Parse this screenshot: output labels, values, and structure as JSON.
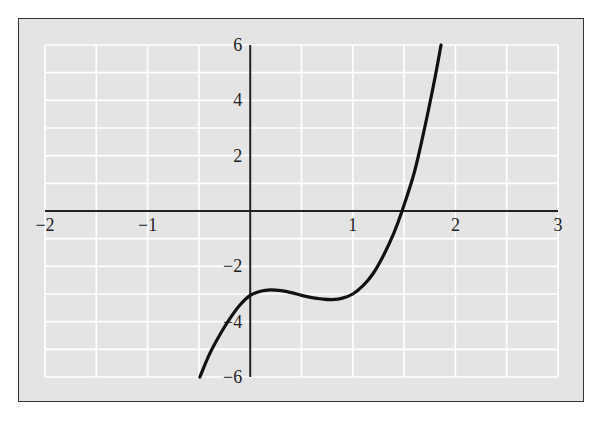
{
  "chart_data": {
    "type": "line",
    "title": "",
    "xlabel": "",
    "ylabel": "",
    "xlim": [
      -2,
      3
    ],
    "ylim": [
      -6,
      6
    ],
    "grid": true,
    "grid_x_step": 0.5,
    "grid_y_step": 1,
    "x_ticks": [
      -2,
      -1,
      1,
      2,
      3
    ],
    "x_tick_labels": [
      "−2",
      "−1",
      "1",
      "2",
      "3"
    ],
    "y_ticks": [
      6,
      4,
      2,
      -2,
      -4,
      -6
    ],
    "y_tick_labels": [
      "6",
      "4",
      "2",
      "−2",
      "−4",
      "−6"
    ],
    "series": [
      {
        "name": "curve",
        "x": [
          -0.49,
          -0.4,
          -0.3,
          -0.2,
          -0.1,
          0,
          0.1,
          0.2,
          0.3,
          0.4,
          0.5,
          0.6,
          0.7,
          0.8,
          0.9,
          1.0,
          1.1,
          1.2,
          1.3,
          1.4,
          1.48,
          1.6,
          1.7,
          1.8,
          1.86
        ],
        "y": [
          -6,
          -5.2,
          -4.5,
          -3.9,
          -3.4,
          -3.05,
          -2.9,
          -2.85,
          -2.88,
          -2.95,
          -3.05,
          -3.13,
          -3.18,
          -3.2,
          -3.15,
          -3.0,
          -2.7,
          -2.25,
          -1.6,
          -0.8,
          0,
          1.4,
          3.0,
          4.8,
          6
        ]
      }
    ],
    "colors": {
      "background": "#e4e4e4",
      "grid": "#ffffff",
      "axis": "#222222",
      "curve": "#111111",
      "frame": "#333333"
    }
  }
}
